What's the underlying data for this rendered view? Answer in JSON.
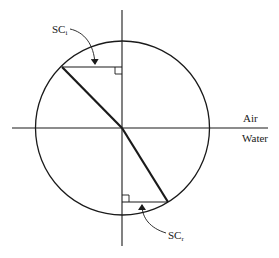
{
  "diagram": {
    "title": "",
    "labels": {
      "incident": {
        "main": "SC",
        "sub": "i"
      },
      "refracted": {
        "main": "SC",
        "sub": "r"
      },
      "upper_medium": "Air",
      "lower_medium": "Water"
    },
    "geometry": {
      "center": [
        122,
        128
      ],
      "radius": 87,
      "incident_point": [
        62,
        67
      ],
      "refracted_point": [
        168,
        202
      ],
      "vertical_axis": {
        "x": 122,
        "y1": 10,
        "y2": 246
      },
      "interface_line": {
        "y": 128,
        "x1": 12,
        "x2": 268
      }
    },
    "colors": {
      "stroke": "#1a1a1a",
      "background": "#ffffff"
    }
  }
}
